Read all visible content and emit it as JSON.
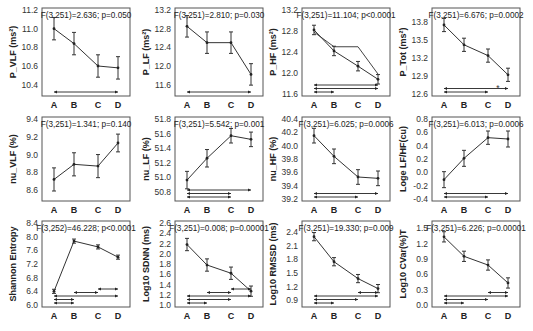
{
  "figure": {
    "layout": {
      "rows": 3,
      "cols": 4
    },
    "groups": [
      "A",
      "B",
      "C",
      "D"
    ]
  },
  "chart_data": [
    {
      "type": "line",
      "panel": "P_VLF",
      "ylabel": "P_VLF (ms²)",
      "stat": "F(3,251)=2.636; p=0.050",
      "categories": [
        "A",
        "B",
        "C",
        "D"
      ],
      "values": [
        11.0,
        10.84,
        10.6,
        10.58
      ],
      "errors": [
        0.12,
        0.12,
        0.12,
        0.12
      ],
      "ylim": [
        10.3,
        11.2
      ],
      "yticks": [
        10.4,
        10.6,
        10.8,
        11.0,
        11.2
      ],
      "comparisons": [
        [
          "A",
          "D"
        ]
      ],
      "extra_lines": []
    },
    {
      "type": "line",
      "panel": "P_LF",
      "ylabel": "P_LF (ms²)",
      "stat": "F(3,251)=2.810; p=0.030",
      "categories": [
        "A",
        "B",
        "C",
        "D"
      ],
      "values": [
        12.85,
        12.5,
        12.5,
        11.82
      ],
      "errors": [
        0.23,
        0.23,
        0.23,
        0.23
      ],
      "ylim": [
        11.4,
        13.2
      ],
      "yticks": [
        11.6,
        12.0,
        12.4,
        12.8,
        13.2
      ],
      "comparisons": [
        [
          "A",
          "D"
        ]
      ],
      "extra_lines": []
    },
    {
      "type": "line",
      "panel": "P_HF",
      "ylabel": "P_HF (ms²)",
      "stat": "F(3,251)=11.104; p<0.0001",
      "categories": [
        "A",
        "B",
        "C",
        "D"
      ],
      "values": [
        12.82,
        12.42,
        12.13,
        11.88
      ],
      "errors": [
        0.09,
        0.09,
        0.09,
        0.09
      ],
      "ylim": [
        11.6,
        13.2
      ],
      "yticks": [
        11.6,
        12.0,
        12.4,
        12.8,
        13.2
      ],
      "comparisons": [
        [
          "A",
          "B"
        ],
        [
          "A",
          "D"
        ],
        [
          "A",
          "D"
        ]
      ],
      "extra_lines": [
        [
          12.78,
          12.5,
          12.5,
          11.98
        ]
      ]
    },
    {
      "type": "line",
      "panel": "P_Tot",
      "ylabel": "P_Tot (ms²)",
      "stat": "F(3,251)=6.676; p=0.0002",
      "categories": [
        "A",
        "B",
        "C",
        "D"
      ],
      "values": [
        13.75,
        13.42,
        13.24,
        12.92
      ],
      "errors": [
        0.11,
        0.11,
        0.11,
        0.11
      ],
      "ylim": [
        12.6,
        14.0
      ],
      "yticks": [
        12.6,
        12.9,
        13.2,
        13.5,
        13.8
      ],
      "comparisons": [
        [
          "A",
          "C"
        ],
        [
          "A",
          "D"
        ]
      ],
      "extra_lines": [],
      "annotation": "*"
    },
    {
      "type": "line",
      "panel": "nu_VLF",
      "ylabel": "nu_VLF (%)",
      "stat": "F(3,251)=1.341; p=0.140",
      "categories": [
        "A",
        "B",
        "C",
        "D"
      ],
      "values": [
        8.72,
        8.89,
        8.87,
        9.13
      ],
      "errors": [
        0.13,
        0.13,
        0.13,
        0.1
      ],
      "ylim": [
        8.5,
        9.4
      ],
      "yticks": [
        8.6,
        8.8,
        9.0,
        9.2,
        9.4
      ],
      "comparisons": [],
      "extra_lines": []
    },
    {
      "type": "line",
      "panel": "nu_LF",
      "ylabel": "nu_LF (%)",
      "stat": "F(3,251)=5.542; p=0.001",
      "categories": [
        "A",
        "B",
        "C",
        "D"
      ],
      "values": [
        50.96,
        51.26,
        51.57,
        51.52
      ],
      "errors": [
        0.12,
        0.12,
        0.1,
        0.1
      ],
      "ylim": [
        50.7,
        51.8
      ],
      "yticks": [
        50.8,
        51.0,
        51.2,
        51.4,
        51.6,
        51.8
      ],
      "comparisons": [
        [
          "A",
          "C"
        ],
        [
          "A",
          "C"
        ],
        [
          "A",
          "D"
        ]
      ],
      "extra_lines": []
    },
    {
      "type": "line",
      "panel": "nu_HF",
      "ylabel": "nu_HF (%)",
      "stat": "F(3,251)=6.025; p=0.0006",
      "categories": [
        "A",
        "B",
        "C",
        "D"
      ],
      "values": [
        40.15,
        39.84,
        39.53,
        39.51
      ],
      "errors": [
        0.11,
        0.11,
        0.11,
        0.11
      ],
      "ylim": [
        39.2,
        40.4
      ],
      "yticks": [
        39.2,
        39.4,
        39.6,
        39.8,
        40.0,
        40.2,
        40.4
      ],
      "comparisons": [
        [
          "A",
          "C"
        ],
        [
          "A",
          "D"
        ]
      ],
      "extra_lines": []
    },
    {
      "type": "line",
      "panel": "Loge LF/HF",
      "ylabel": "Loge LF/HF(cu)",
      "stat": "F(3,251)=6.013; p=0.0006",
      "categories": [
        "A",
        "B",
        "C",
        "D"
      ],
      "values": [
        -0.11,
        0.21,
        0.52,
        0.5
      ],
      "errors": [
        0.12,
        0.12,
        0.1,
        0.12
      ],
      "ylim": [
        -0.4,
        0.8
      ],
      "yticks": [
        -0.4,
        -0.2,
        0.0,
        0.2,
        0.4,
        0.6,
        0.8
      ],
      "comparisons": [
        [
          "A",
          "C"
        ],
        [
          "A",
          "D"
        ]
      ],
      "extra_lines": []
    },
    {
      "type": "line",
      "panel": "Shannon Entropy",
      "ylabel": "Shannon Entropy",
      "stat": "F(3,252)=46.228; p<0.0001",
      "categories": [
        "A",
        "B",
        "C",
        "D"
      ],
      "values": [
        6.4,
        7.87,
        7.7,
        7.4
      ],
      "errors": [
        0.06,
        0.06,
        0.06,
        0.06
      ],
      "ylim": [
        6.0,
        8.4
      ],
      "yticks": [
        6.0,
        6.4,
        6.8,
        7.2,
        7.6,
        8.0,
        8.4
      ],
      "comparisons": [
        [
          "A",
          "B"
        ],
        [
          "A",
          "B"
        ],
        [
          "A",
          "D"
        ],
        [
          "B",
          "C"
        ],
        [
          "C",
          "D"
        ]
      ],
      "extra_lines": []
    },
    {
      "type": "line",
      "panel": "Log10 SDNN",
      "ylabel": "Log10 SDNN (ms)",
      "stat": "F(3,251)=0.008; p=0.00001",
      "categories": [
        "A",
        "B",
        "C",
        "D"
      ],
      "values": [
        2.18,
        1.78,
        1.62,
        1.27
      ],
      "errors": [
        0.12,
        0.12,
        0.12,
        0.1
      ],
      "ylim": [
        1.0,
        2.6
      ],
      "yticks": [
        1.0,
        1.2,
        1.4,
        1.6,
        1.8,
        2.0,
        2.2,
        2.4,
        2.6
      ],
      "comparisons": [
        [
          "A",
          "B"
        ],
        [
          "A",
          "C"
        ],
        [
          "A",
          "D"
        ],
        [
          "B",
          "C"
        ],
        [
          "C",
          "D"
        ]
      ],
      "extra_lines": []
    },
    {
      "type": "line",
      "panel": "Log10 RMSSD",
      "ylabel": "Log10 RMSSD (ms)",
      "stat": "F(3,251)=19.330; p=0.009",
      "categories": [
        "A",
        "B",
        "C",
        "D"
      ],
      "values": [
        2.3,
        1.75,
        1.38,
        1.16
      ],
      "errors": [
        0.09,
        0.09,
        0.09,
        0.09
      ],
      "ylim": [
        0.8,
        2.6
      ],
      "yticks": [
        0.9,
        1.2,
        1.5,
        1.8,
        2.1,
        2.4
      ],
      "comparisons": [
        [
          "A",
          "B"
        ],
        [
          "A",
          "C"
        ],
        [
          "A",
          "D"
        ],
        [
          "C",
          "D"
        ]
      ],
      "extra_lines": []
    },
    {
      "type": "line",
      "panel": "Log10 CVar(%)T",
      "ylabel": "Log10 CVar(%)T",
      "stat": "F(3,251)=6.226; p=0.00001",
      "categories": [
        "A",
        "B",
        "C",
        "D"
      ],
      "values": [
        1.33,
        0.95,
        0.78,
        0.43
      ],
      "errors": [
        0.1,
        0.1,
        0.1,
        0.1
      ],
      "ylim": [
        0.0,
        1.6
      ],
      "yticks": [
        0.0,
        0.3,
        0.6,
        0.9,
        1.2,
        1.5
      ],
      "comparisons": [
        [
          "A",
          "B"
        ],
        [
          "A",
          "C"
        ],
        [
          "A",
          "D"
        ],
        [
          "C",
          "D"
        ]
      ],
      "extra_lines": []
    }
  ]
}
